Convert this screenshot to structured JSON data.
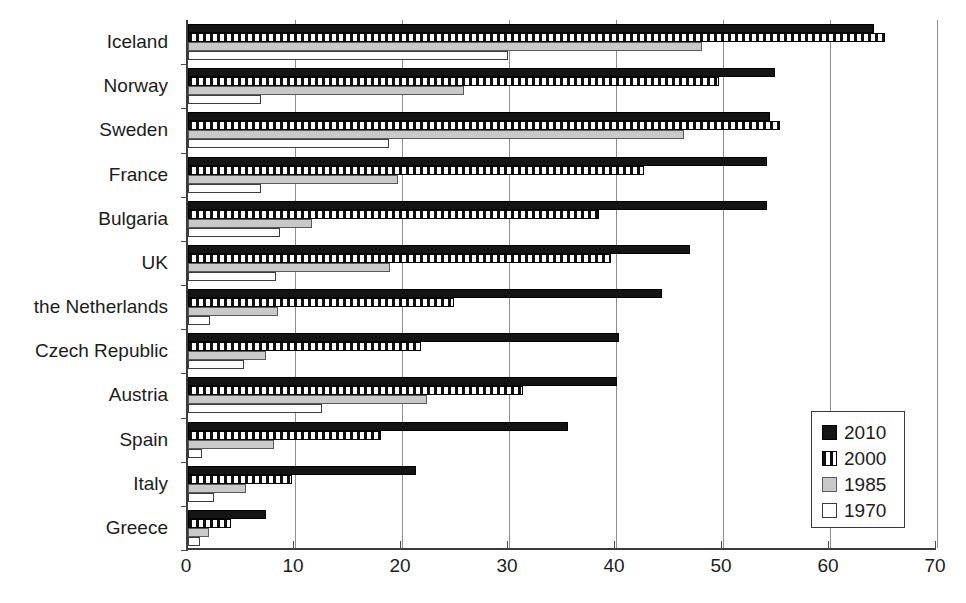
{
  "chart_data": {
    "type": "bar",
    "orientation": "horizontal",
    "title": "",
    "subtitle": "",
    "xlabel": "",
    "ylabel": "",
    "xlim": [
      0,
      70
    ],
    "xticks": [
      0,
      10,
      20,
      30,
      40,
      50,
      60,
      70
    ],
    "grid": true,
    "grid_axis": "x",
    "legend_position": "bottom-right",
    "categories": [
      "Iceland",
      "Norway",
      "Sweden",
      "France",
      "Bulgaria",
      "UK",
      "the Netherlands",
      "Czech Republic",
      "Austria",
      "Spain",
      "Italy",
      "Greece"
    ],
    "series": [
      {
        "name": "2010",
        "color": "#141414",
        "pattern": "solid",
        "values": [
          64.1,
          54.9,
          54.4,
          54.1,
          54.1,
          46.9,
          44.3,
          40.3,
          40.1,
          35.5,
          21.3,
          7.3
        ]
      },
      {
        "name": "2000",
        "color": "#111111",
        "pattern": "vertical-hatch",
        "values": [
          65.1,
          49.6,
          55.3,
          42.6,
          38.4,
          39.5,
          24.9,
          21.8,
          31.3,
          18.0,
          9.7,
          4.0
        ]
      },
      {
        "name": "1985",
        "color": "#c9c9c9",
        "pattern": "gray",
        "values": [
          48.0,
          25.8,
          46.4,
          19.6,
          11.6,
          18.9,
          8.4,
          7.3,
          22.3,
          8.0,
          5.4,
          2.0
        ]
      },
      {
        "name": "1970",
        "color": "#ffffff",
        "pattern": "empty",
        "values": [
          29.9,
          6.8,
          18.8,
          6.8,
          8.6,
          8.2,
          2.1,
          5.2,
          12.5,
          1.3,
          2.4,
          1.1
        ]
      }
    ]
  },
  "legend": {
    "items": [
      {
        "label": "2010"
      },
      {
        "label": "2000"
      },
      {
        "label": "1985"
      },
      {
        "label": "1970"
      }
    ]
  },
  "axis": {
    "x_tick_labels": [
      "0",
      "10",
      "20",
      "30",
      "40",
      "50",
      "60",
      "70"
    ]
  },
  "colors": {
    "series_2010": "#141414",
    "series_2000": "#111111",
    "series_1985": "#c9c9c9",
    "series_1970": "#ffffff",
    "axis": "#3a3a3a",
    "grid": "#8d8d8d",
    "text": "#1c1c1c",
    "background": "#ffffff"
  }
}
